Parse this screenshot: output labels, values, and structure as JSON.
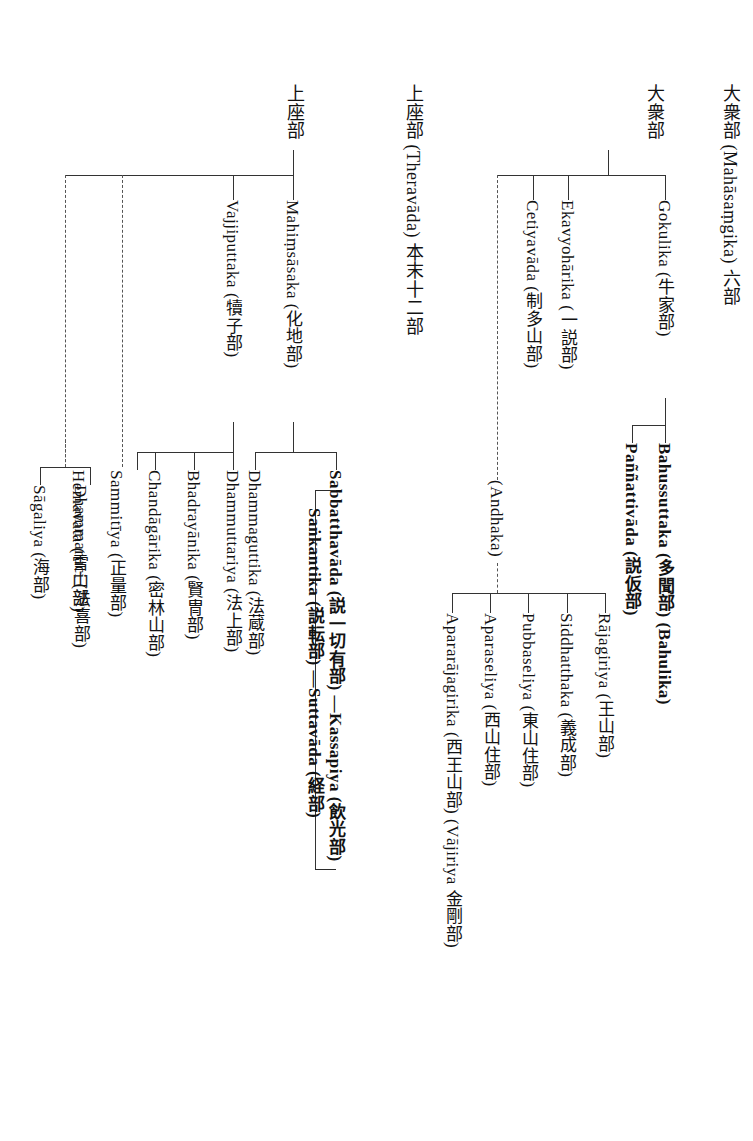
{
  "document": {
    "title": "Buddhist schools lineage chart (vertical Japanese)",
    "orientation": "vertical-rl",
    "width": 753,
    "height": 1141,
    "background": "#ffffff",
    "line_color": "#333333"
  },
  "roots": {
    "mahasamghika": "大衆部 (Mahāsaṃgika) 六部",
    "mahasamghika_short": "大衆部",
    "theravada": "上座部 (Theravāda) 本末十二部",
    "theravada_short": "上座部"
  },
  "nodes": {
    "gokulika": "Gokulika (牛家部)",
    "ekavyoharika": "Ekavyohārika (一説部)",
    "cetiyavada": "Cetiyavāda (制多山部)",
    "andhaka": "(Andhaka)",
    "bahussuttaka": "Bahussuttaka (多聞部) (Bahulika)",
    "pannattivada": "Paññattivāda (説仮部)",
    "rajagiriya": "Rājagiriya (王山部)",
    "siddhatthaka": "Siddhatthaka (義成部)",
    "pubbaseliya": "Pubbaseliya (東山住部)",
    "aparaseliya": "Aparaseliya (西山住部)",
    "apararajagirika": "Apararājagirika (西王山部) (Vājiriya 金剛部)",
    "mahimsasaka": "Mahiṃsāsaka (化地部)",
    "vajjiputtaka": "Vajjiputtaka (犢子部)",
    "sabbatthavada": "Sabbatthavāda (説一切有部) ―Kassapiya (飲光部)",
    "sankantika": "Saṅkantika (説転部) ―Suttavāda (経部)",
    "dhammaguttika": "Dhammaguttika (法蔵部)",
    "dhammuttariya": "Dhammuttariya (法上部)",
    "bhadrayanika": "Bhadrayānika (賢冑部)",
    "chandagarika": "Chandāgārika (密林山部)",
    "sammitiya": "Sammitīya (正量部)",
    "hemavata": "Hemavata (雪山部)",
    "dhammaruci": "Dhammaruci (法喜部)",
    "sagaliya": "Sāgaliya (海部)"
  }
}
